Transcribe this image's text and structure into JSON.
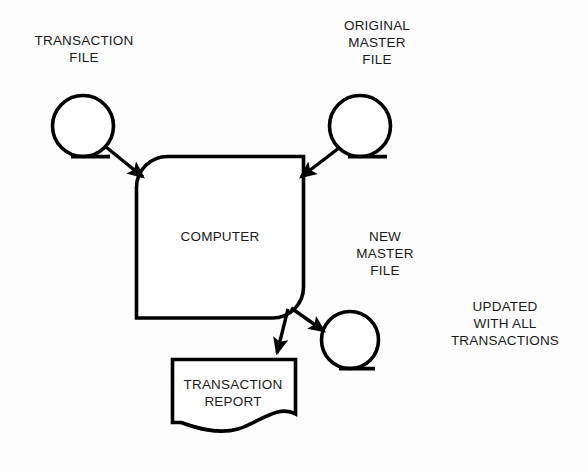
{
  "diagram": {
    "background_color": "#fdfdfd",
    "stroke_color": "#000000",
    "text_color": "#1a1a1a",
    "nodes": {
      "transaction_file": {
        "shape": "magnetic-tape",
        "label_lines": [
          "TRANSACTION",
          "FILE"
        ],
        "line1": "TRANSACTION",
        "line2": "FILE"
      },
      "original_master_file": {
        "shape": "magnetic-tape",
        "label_lines": [
          "ORIGINAL",
          "MASTER",
          "FILE"
        ],
        "line1": "ORIGINAL",
        "line2": "MASTER",
        "line3": "FILE"
      },
      "computer": {
        "shape": "process",
        "label": "COMPUTER"
      },
      "new_master_file": {
        "shape": "magnetic-tape",
        "label_lines": [
          "NEW",
          "MASTER",
          "FILE"
        ],
        "line1": "NEW",
        "line2": "MASTER",
        "line3": "FILE"
      },
      "transaction_report": {
        "shape": "document",
        "label_lines": [
          "TRANSACTION",
          "REPORT"
        ],
        "line1": "TRANSACTION",
        "line2": "REPORT"
      },
      "updated_note": {
        "shape": "annotation-text",
        "label_lines": [
          "UPDATED",
          "WITH ALL",
          "TRANSACTIONS"
        ],
        "line1": "UPDATED",
        "line2": "WITH ALL",
        "line3": "TRANSACTIONS"
      }
    },
    "connectors": [
      {
        "name": "transaction-file-to-computer",
        "from": "transaction_file",
        "to": "computer",
        "direction": "down-right"
      },
      {
        "name": "original-master-to-computer",
        "from": "original_master_file",
        "to": "computer",
        "direction": "down-left"
      },
      {
        "name": "computer-to-transaction-report",
        "from": "computer",
        "to": "transaction_report",
        "direction": "down-left"
      },
      {
        "name": "computer-to-new-master",
        "from": "computer",
        "to": "new_master_file",
        "direction": "down-right"
      }
    ]
  }
}
